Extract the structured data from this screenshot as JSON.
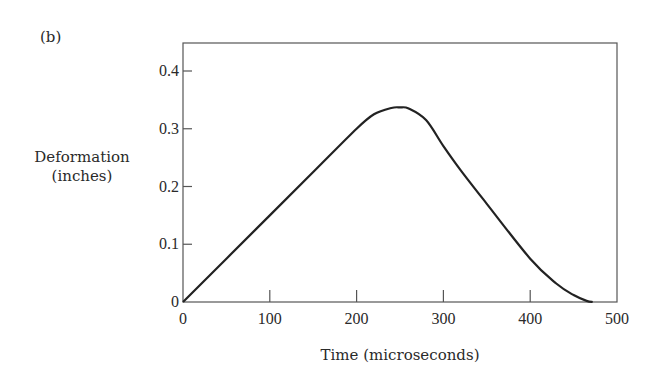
{
  "panel_label": "(b)",
  "chart_data": {
    "type": "line",
    "title": "",
    "xlabel": "Time (microseconds)",
    "ylabel": "Deformation (inches)",
    "ylabel_lines": [
      "Deformation",
      "(inches)"
    ],
    "xlim": [
      0,
      500
    ],
    "ylim": [
      0,
      0.45
    ],
    "x_ticks": [
      0,
      100,
      200,
      300,
      400,
      500
    ],
    "x_tick_labels": [
      "0",
      "100",
      "200",
      "300",
      "400",
      "500"
    ],
    "y_ticks": [
      0,
      0.1,
      0.2,
      0.3,
      0.4
    ],
    "y_tick_labels": [
      "0",
      "0.1",
      "0.2",
      "0.3",
      "0.4"
    ],
    "grid": false,
    "legend": null,
    "series": [
      {
        "name": "deformation",
        "x": [
          0,
          50,
          100,
          150,
          200,
          220,
          240,
          250,
          260,
          280,
          300,
          320,
          350,
          400,
          430,
          450,
          465,
          472
        ],
        "y": [
          0,
          0.075,
          0.15,
          0.225,
          0.3,
          0.325,
          0.336,
          0.337,
          0.335,
          0.315,
          0.27,
          0.228,
          0.17,
          0.075,
          0.032,
          0.012,
          0.002,
          0
        ]
      }
    ],
    "line_color": "#222222"
  }
}
